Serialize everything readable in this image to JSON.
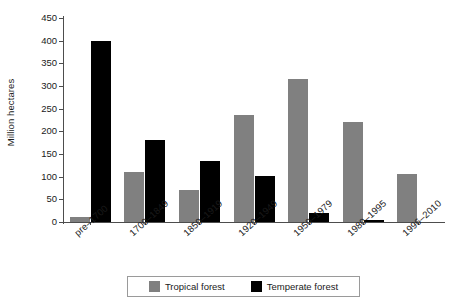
{
  "chart_data": {
    "type": "bar",
    "title": "",
    "subtitle": "",
    "xlabel": "",
    "ylabel": "Million hectares",
    "ylim": [
      0,
      450
    ],
    "yticks": [
      0,
      50,
      100,
      150,
      200,
      250,
      300,
      350,
      400,
      450
    ],
    "ytick_labels": [
      "0",
      "50",
      "100",
      "150",
      "200",
      "250",
      "300",
      "350",
      "400",
      "450"
    ],
    "grid": false,
    "legend_position": "bottom",
    "categories": [
      "pre–1700",
      "1700–1849",
      "1850–1919",
      "1920–1949",
      "1950–1979",
      "1980–1995",
      "1996–2010"
    ],
    "series": [
      {
        "name": "Tropical forest",
        "color": "#808080",
        "values": [
          10,
          110,
          70,
          235,
          315,
          220,
          105
        ]
      },
      {
        "name": "Temperate forest",
        "color": "#000000",
        "values": [
          400,
          180,
          135,
          102,
          20,
          5,
          0
        ]
      }
    ]
  },
  "legend": {
    "items": [
      {
        "label": "Tropical forest",
        "color": "#808080"
      },
      {
        "label": "Temperate forest",
        "color": "#000000"
      }
    ]
  },
  "axes": {
    "y_title": "Million hectares",
    "axis_color": "#4d4d4d"
  }
}
